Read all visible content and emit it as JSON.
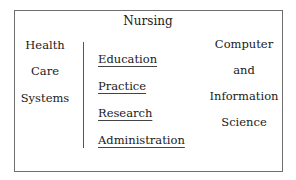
{
  "diagram": {
    "title": "Nursing",
    "left_column": {
      "lines": [
        "Health",
        "Care",
        "Systems"
      ]
    },
    "center_column": {
      "items": [
        "Education",
        "Practice",
        "Research",
        "Administration"
      ],
      "style": "underlined"
    },
    "right_column": {
      "lines": [
        "Computer",
        "and",
        "Information",
        "Science"
      ]
    },
    "colors": {
      "border": "#6e6e6e",
      "divider": "#555555",
      "text": "#1a1a1a",
      "background": "#ffffff"
    }
  }
}
